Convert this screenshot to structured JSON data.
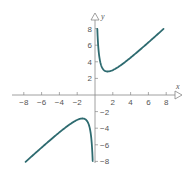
{
  "chart_data": {
    "type": "line",
    "title": "",
    "xlabel": "x",
    "ylabel": "y",
    "xlim": [
      -9,
      9
    ],
    "ylim": [
      -9,
      9
    ],
    "grid": false,
    "xticks": [
      -8,
      -6,
      -4,
      -2,
      2,
      4,
      6,
      8
    ],
    "yticks": [
      8,
      6,
      4,
      2,
      -2,
      -4,
      -6,
      -8
    ],
    "xtick_labels": [
      "-8",
      "-6",
      "-4",
      "-2",
      "2",
      "4",
      "6",
      "8"
    ],
    "ytick_labels": [
      "8",
      "6",
      "4",
      "2",
      "-2",
      "-4",
      "-6",
      "-8"
    ],
    "series": [
      {
        "name": "f(x) = x + 2/x",
        "color": "#2e6b70",
        "branches": [
          {
            "x": [
              0.26,
              0.3,
              0.4,
              0.5,
              0.7,
              1.0,
              1.41,
              2,
              3,
              4,
              5,
              6,
              7,
              7.7
            ],
            "y": [
              7.95,
              6.97,
              5.4,
              4.5,
              3.56,
              3.0,
              2.83,
              3.0,
              3.67,
              4.5,
              5.4,
              6.33,
              7.29,
              7.96
            ]
          },
          {
            "x": [
              -7.8,
              -7,
              -6,
              -5,
              -4,
              -3,
              -2,
              -1.41,
              -1.0,
              -0.7,
              -0.5,
              -0.4,
              -0.3,
              -0.26
            ],
            "y": [
              -8.06,
              -7.29,
              -6.33,
              -5.4,
              -4.5,
              -3.67,
              -3.0,
              -2.83,
              -3.0,
              -3.56,
              -4.5,
              -5.4,
              -6.97,
              -7.95
            ]
          }
        ]
      }
    ],
    "axis_color": "#888888"
  }
}
